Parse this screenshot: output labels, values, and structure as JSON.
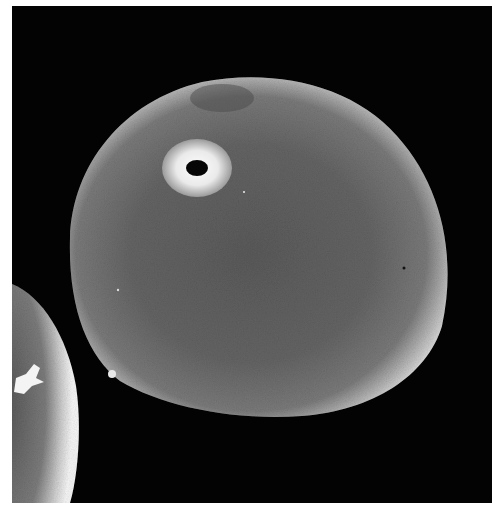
{
  "image": {
    "description": "Scanning electron micrograph of a pollen grain with a single pore",
    "style": "grayscale",
    "background_color": "#030303",
    "page_background": "#ffffff"
  },
  "subjects": [
    {
      "name": "main-pollen-grain",
      "shape": "rounded ovoid",
      "features": [
        "single annulate pore",
        "finely granular surface",
        "bright rim edge"
      ]
    },
    {
      "name": "partial-pollen-grain",
      "position": "bottom-left, cut off by frame",
      "features": [
        "bright crack/highlight on surface"
      ]
    }
  ],
  "colors": {
    "surface": "#6a6a6a",
    "surface_dark": "#4e4e4e",
    "rim": "#f2f2f2",
    "pore_ring": "#e4e4e4",
    "pore_hole": "#060606"
  }
}
